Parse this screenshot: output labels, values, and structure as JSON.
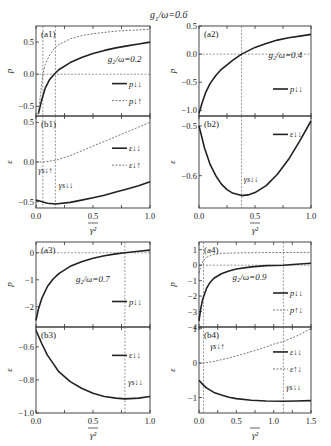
{
  "suptitle": "g_1/ω=0.6",
  "chart_data": [
    {
      "panel": "(a1)",
      "type": "line",
      "ylabel": "p",
      "xlim": [
        0,
        1.0
      ],
      "ylim": [
        -0.65,
        0.75
      ],
      "yticks": [
        -0.5,
        0.0,
        0.5
      ],
      "ytick_labels": [
        "−0.5",
        "0.0",
        "0.5"
      ],
      "xticks": [
        0.0,
        0.5,
        1.0
      ],
      "annotation": "g_2/ω=0.2",
      "legend": [
        "p_{↓↓}",
        "p_{↓↑}"
      ],
      "series": [
        {
          "name": "p_{↓↓}",
          "style": "solid",
          "x": [
            0.02,
            0.05,
            0.08,
            0.12,
            0.16,
            0.2,
            0.3,
            0.4,
            0.5,
            0.6,
            0.7,
            0.8,
            0.9,
            1.0
          ],
          "y": [
            -0.62,
            -0.4,
            -0.22,
            -0.08,
            0.0,
            0.07,
            0.18,
            0.26,
            0.32,
            0.37,
            0.41,
            0.44,
            0.47,
            0.5
          ]
        },
        {
          "name": "p_{↓↑}",
          "style": "dashed",
          "x": [
            0.02,
            0.04,
            0.06,
            0.08,
            0.12,
            0.16,
            0.2,
            0.3,
            0.4,
            0.5,
            0.6,
            0.7,
            0.8,
            0.9,
            1.0
          ],
          "y": [
            -0.62,
            -0.3,
            0.0,
            0.15,
            0.3,
            0.4,
            0.46,
            0.55,
            0.6,
            0.63,
            0.65,
            0.67,
            0.68,
            0.69,
            0.7
          ]
        }
      ],
      "hlines": [
        0.0
      ],
      "vlines": [
        0.06,
        0.17
      ]
    },
    {
      "panel": "(b1)",
      "type": "line",
      "ylabel": "ε",
      "xlabel": "γ²",
      "xlim": [
        0,
        1.0
      ],
      "ylim": [
        -0.58,
        0.58
      ],
      "yticks": [
        -0.5,
        0.0,
        0.5
      ],
      "ytick_labels": [
        "−0.5",
        "0.0",
        "0.5"
      ],
      "xticks": [
        0.0,
        0.5,
        1.0
      ],
      "xtick_labels": [
        "0.0",
        "0.5",
        "1.0"
      ],
      "legend": [
        "ε_{↓↓}",
        "ε_{↓↑}"
      ],
      "annotations": [
        "γ_{s↓↑}",
        "γ_{s↓↓}"
      ],
      "series": [
        {
          "name": "ε_{↓↓}",
          "style": "solid",
          "x": [
            0.0,
            0.1,
            0.17,
            0.3,
            0.4,
            0.5,
            0.6,
            0.7,
            0.8,
            0.9,
            1.0
          ],
          "y": [
            -0.48,
            -0.52,
            -0.53,
            -0.51,
            -0.48,
            -0.45,
            -0.42,
            -0.38,
            -0.34,
            -0.3,
            -0.25
          ]
        },
        {
          "name": "ε_{↓↑}",
          "style": "dashed",
          "x": [
            0.0,
            0.06,
            0.17,
            0.3,
            0.4,
            0.5,
            0.6,
            0.7,
            0.8,
            0.9,
            1.0
          ],
          "y": [
            0.0,
            0.0,
            0.02,
            0.08,
            0.14,
            0.2,
            0.26,
            0.32,
            0.38,
            0.44,
            0.5
          ]
        }
      ],
      "vlines": [
        0.06,
        0.17
      ]
    },
    {
      "panel": "(a2)",
      "type": "line",
      "ylabel": "p",
      "xlim": [
        0,
        1.0
      ],
      "ylim": [
        -1.1,
        0.5
      ],
      "yticks": [
        -1.0,
        -0.5,
        0.0,
        0.5
      ],
      "ytick_labels": [
        "−1.0",
        "−0.5",
        "0.0",
        "0.5"
      ],
      "xticks": [
        0.0,
        0.5,
        1.0
      ],
      "annotation": "g_2/ω=0.4",
      "legend": [
        "p_{↓↓}"
      ],
      "series": [
        {
          "name": "p_{↓↓}",
          "style": "solid",
          "x": [
            0.0,
            0.03,
            0.06,
            0.1,
            0.15,
            0.2,
            0.3,
            0.38,
            0.5,
            0.6,
            0.7,
            0.8,
            0.9,
            1.0
          ],
          "y": [
            -1.05,
            -0.85,
            -0.68,
            -0.52,
            -0.38,
            -0.27,
            -0.11,
            0.0,
            0.12,
            0.19,
            0.25,
            0.29,
            0.32,
            0.35
          ]
        }
      ],
      "hlines": [
        0.0
      ],
      "vlines": [
        0.38
      ]
    },
    {
      "panel": "(b2)",
      "type": "line",
      "ylabel": "ε",
      "xlabel": "γ²",
      "xlim": [
        0,
        1.0
      ],
      "ylim": [
        -0.665,
        -0.48
      ],
      "yticks": [
        -0.6,
        -0.5
      ],
      "ytick_labels": [
        "−0.6",
        "−0.5"
      ],
      "xticks": [
        0.0,
        0.5,
        1.0
      ],
      "xtick_labels": [
        "0.0",
        "0.5",
        "1.0"
      ],
      "legend": [
        "ε_{↓↓}"
      ],
      "annotations": [
        "γ_{s↓↓}"
      ],
      "series": [
        {
          "name": "ε_{↓↓}",
          "style": "solid",
          "x": [
            0.0,
            0.05,
            0.1,
            0.15,
            0.2,
            0.25,
            0.3,
            0.38,
            0.45,
            0.5,
            0.6,
            0.7,
            0.8,
            0.9,
            1.0
          ],
          "y": [
            -0.5,
            -0.545,
            -0.578,
            -0.6,
            -0.617,
            -0.628,
            -0.635,
            -0.64,
            -0.638,
            -0.634,
            -0.62,
            -0.597,
            -0.567,
            -0.53,
            -0.49
          ]
        }
      ],
      "vlines": [
        0.38
      ]
    },
    {
      "panel": "(a3)",
      "type": "line",
      "ylabel": "p",
      "xlim": [
        0,
        1.0
      ],
      "ylim": [
        -2.75,
        0.4
      ],
      "yticks": [
        -2,
        -1,
        0
      ],
      "ytick_labels": [
        "−2",
        "−1",
        "0"
      ],
      "xticks": [
        0.0,
        0.5,
        1.0
      ],
      "annotation": "g_2/ω=0.7",
      "legend": [
        "p_{↓↓}"
      ],
      "series": [
        {
          "name": "p_{↓↓}",
          "style": "solid",
          "x": [
            0.0,
            0.02,
            0.05,
            0.1,
            0.15,
            0.2,
            0.3,
            0.4,
            0.5,
            0.6,
            0.7,
            0.78,
            0.9,
            1.0
          ],
          "y": [
            -2.5,
            -2.1,
            -1.7,
            -1.25,
            -0.97,
            -0.77,
            -0.5,
            -0.33,
            -0.2,
            -0.11,
            -0.04,
            0.0,
            0.06,
            0.1
          ]
        }
      ],
      "hlines": [
        0
      ],
      "vlines": [
        0.78
      ]
    },
    {
      "panel": "(b3)",
      "type": "line",
      "ylabel": "ε",
      "xlabel": "γ²",
      "xlim": [
        0,
        1.0
      ],
      "ylim": [
        -1.0,
        -0.48
      ],
      "yticks": [
        -1.0,
        -0.8,
        -0.6
      ],
      "ytick_labels": [
        "−1.0",
        "−0.8",
        "−0.6"
      ],
      "xticks": [
        0.0,
        0.5,
        1.0
      ],
      "xtick_labels": [
        "0.0",
        "0.5",
        "1.0"
      ],
      "legend": [
        "ε_{↓↓}"
      ],
      "annotations": [
        "γ_{s↓↓}"
      ],
      "series": [
        {
          "name": "ε_{↓↓}",
          "style": "solid",
          "x": [
            0.0,
            0.05,
            0.1,
            0.15,
            0.2,
            0.3,
            0.4,
            0.5,
            0.6,
            0.7,
            0.78,
            0.9,
            1.0
          ],
          "y": [
            -0.5,
            -0.58,
            -0.65,
            -0.7,
            -0.75,
            -0.81,
            -0.85,
            -0.88,
            -0.9,
            -0.91,
            -0.915,
            -0.91,
            -0.9
          ]
        }
      ],
      "vlines": [
        0.78
      ]
    },
    {
      "panel": "(a4)",
      "type": "line",
      "ylabel": "p",
      "xlim": [
        0,
        1.5
      ],
      "ylim": [
        -4.0,
        1.5
      ],
      "yticks": [
        -4,
        -3,
        -2,
        -1,
        0,
        1
      ],
      "ytick_labels": [
        "−4",
        "−3",
        "−2",
        "−1",
        "0",
        "1"
      ],
      "xticks": [
        0.0,
        0.5,
        1.0,
        1.5
      ],
      "annotation": "g_2/ω=0.9",
      "legend": [
        "p_{↓↓}",
        "p_{↑↓}"
      ],
      "series": [
        {
          "name": "p_{↓↓}",
          "style": "solid",
          "x": [
            0.0,
            0.02,
            0.05,
            0.1,
            0.15,
            0.2,
            0.3,
            0.4,
            0.5,
            0.7,
            0.9,
            1.13,
            1.3,
            1.5
          ],
          "y": [
            -3.6,
            -2.9,
            -2.2,
            -1.5,
            -1.1,
            -0.85,
            -0.55,
            -0.37,
            -0.25,
            -0.11,
            -0.03,
            0.0,
            0.06,
            0.12
          ]
        },
        {
          "name": "p_{↑↓}",
          "style": "dashed",
          "x": [
            0.0,
            0.03,
            0.06,
            0.1,
            0.15,
            0.2,
            0.3,
            0.4,
            0.6,
            0.8,
            1.0,
            1.2,
            1.5
          ],
          "y": [
            -0.5,
            0.0,
            0.3,
            0.5,
            0.62,
            0.7,
            0.76,
            0.78,
            0.8,
            0.81,
            0.82,
            0.82,
            0.83
          ]
        }
      ],
      "hlines": [
        0
      ],
      "vlines": [
        0.06,
        1.13
      ]
    },
    {
      "panel": "(b4)",
      "type": "line",
      "ylabel": "ε",
      "xlabel": "γ²",
      "xlim": [
        0,
        1.5
      ],
      "ylim": [
        -1.45,
        1.05
      ],
      "yticks": [
        -1,
        0,
        1
      ],
      "ytick_labels": [
        "−1",
        "0",
        "1"
      ],
      "xticks": [
        0.0,
        0.5,
        1.0,
        1.5
      ],
      "xtick_labels": [
        "0.0",
        "0.5",
        "1.0",
        "1.5"
      ],
      "legend": [
        "ε_{↓↓}",
        "ε_{↑↓}"
      ],
      "annotations": [
        "γ_{s↓↑}",
        "γ_{s↓↓}"
      ],
      "series": [
        {
          "name": "ε_{↓↓}",
          "style": "solid",
          "x": [
            0.0,
            0.05,
            0.1,
            0.2,
            0.3,
            0.4,
            0.5,
            0.7,
            0.9,
            1.13,
            1.3,
            1.5
          ],
          "y": [
            -0.5,
            -0.62,
            -0.72,
            -0.85,
            -0.93,
            -0.99,
            -1.03,
            -1.08,
            -1.1,
            -1.11,
            -1.1,
            -1.09
          ]
        },
        {
          "name": "ε_{↑↓}",
          "style": "dashed",
          "x": [
            0.0,
            0.06,
            0.2,
            0.4,
            0.6,
            0.8,
            1.0,
            1.13,
            1.3,
            1.5
          ],
          "y": [
            0.0,
            0.0,
            0.05,
            0.15,
            0.27,
            0.4,
            0.55,
            0.63,
            0.78,
            1.0
          ]
        }
      ],
      "vlines": [
        0.06,
        1.13
      ]
    }
  ],
  "labels": {
    "a1": "(a1)",
    "b1": "(b1)",
    "a2": "(a2)",
    "b2": "(b2)",
    "a3": "(a3)",
    "b3": "(b3)",
    "a4": "(a4)",
    "b4": "(b4)",
    "g2_a1": "g₂/ω=0.2",
    "g2_a2": "g₂/ω=0.4",
    "g2_a3": "g₂/ω=0.7",
    "g2_a4": "g₂/ω=0.9",
    "p": "p",
    "eps": "ε",
    "xlabel": "γ²",
    "leg_pdd": "p↓↓",
    "leg_pdu": "p↓↑",
    "leg_pud": "p↑↓",
    "leg_edd": "ε↓↓",
    "leg_edu": "ε↓↑",
    "leg_eud": "ε↑↓",
    "gs_du": "γs↓↑",
    "gs_dd": "γs↓↓"
  }
}
